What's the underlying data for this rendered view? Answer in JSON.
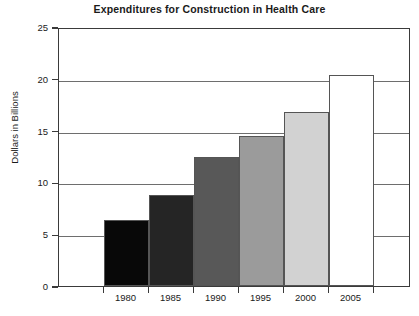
{
  "chart_data": {
    "type": "bar",
    "title": "Expenditures for Construction in Health Care",
    "xlabel": "",
    "ylabel": "Dollars in Billions",
    "categories": [
      "1980",
      "1985",
      "1990",
      "1995",
      "2000",
      "2005"
    ],
    "values": [
      6.4,
      8.8,
      12.5,
      14.5,
      16.8,
      20.4
    ],
    "ylim": [
      0,
      25
    ],
    "yticks": [
      0,
      5,
      10,
      15,
      20,
      25
    ],
    "ytick_labels": [
      "0",
      "5",
      "10",
      "15",
      "20",
      "25"
    ],
    "grid": true,
    "grid_axis": "y",
    "legend": false,
    "bar_colors": [
      "#080808",
      "#252525",
      "#585858",
      "#9b9b9b",
      "#d2d2d2",
      "#ffffff"
    ],
    "bar_edge_color": "#555555",
    "axis_color": "#3a3a3a",
    "background_color": "#ffffff",
    "bars_contiguous": true
  }
}
